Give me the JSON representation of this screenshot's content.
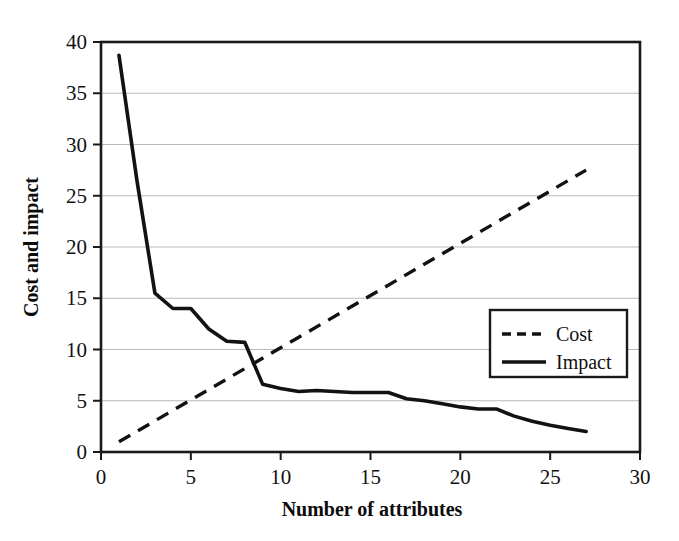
{
  "chart_data": {
    "type": "line",
    "title": "",
    "xlabel": "Number of attributes",
    "ylabel": "Cost and impact",
    "xlim": [
      0,
      30
    ],
    "ylim": [
      0,
      40
    ],
    "xticks": [
      "0",
      "5",
      "10",
      "15",
      "20",
      "25",
      "30"
    ],
    "yticks": [
      "0",
      "5",
      "10",
      "15",
      "20",
      "25",
      "30",
      "35",
      "40"
    ],
    "grid": "horizontal",
    "legend_position": "center-right",
    "series": [
      {
        "name": "Cost",
        "style": "dashed",
        "color": "#121212",
        "x": [
          1,
          27
        ],
        "values": [
          1.0,
          27.5
        ]
      },
      {
        "name": "Impact",
        "style": "solid",
        "color": "#121212",
        "x": [
          1,
          2,
          3,
          4,
          5,
          6,
          7,
          8,
          9,
          10,
          11,
          12,
          13,
          14,
          15,
          16,
          17,
          18,
          19,
          20,
          21,
          22,
          23,
          24,
          25,
          26,
          27
        ],
        "values": [
          38.7,
          26.5,
          15.5,
          14.0,
          14.0,
          12.0,
          10.8,
          10.7,
          6.6,
          6.2,
          5.9,
          6.0,
          5.9,
          5.8,
          5.8,
          5.8,
          5.2,
          5.0,
          4.7,
          4.4,
          4.2,
          4.2,
          3.5,
          3.0,
          2.6,
          2.3,
          2.0
        ]
      }
    ]
  },
  "axis": {
    "x_title": "Number of attributes",
    "y_title": "Cost and impact"
  },
  "legend": {
    "entries": [
      {
        "label": "Cost",
        "style": "dashed"
      },
      {
        "label": "Impact",
        "style": "solid"
      }
    ]
  }
}
